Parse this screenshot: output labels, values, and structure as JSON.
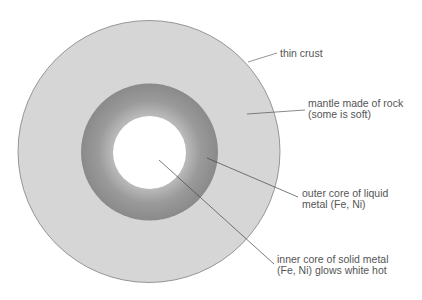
{
  "diagram": {
    "colors": {
      "crust_outline": "#888888",
      "mantle_fill": "#d6d6d6",
      "outer_core_fill": "#8f8f8f",
      "outer_core_highlight": "#b5b5b5",
      "inner_core_fill": "#ffffff",
      "leader_line": "#555555",
      "text": "#555555"
    },
    "layers": [
      {
        "name": "crust",
        "label_lines": [
          "thin crust"
        ]
      },
      {
        "name": "mantle",
        "label_lines": [
          "mantle made of rock",
          "(some is soft)"
        ]
      },
      {
        "name": "outer-core",
        "label_lines": [
          "outer core of liquid",
          "metal (Fe, Ni)"
        ]
      },
      {
        "name": "inner-core",
        "label_lines": [
          "inner core of solid metal",
          "(Fe, Ni) glows white hot"
        ]
      }
    ]
  }
}
